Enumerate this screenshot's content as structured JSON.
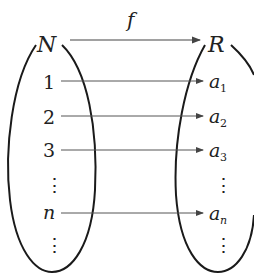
{
  "diagram": {
    "type": "mapping",
    "function_label": "f",
    "domain_set": {
      "label": "N",
      "elements": [
        "1",
        "2",
        "3",
        "⋮",
        "n",
        "⋮"
      ]
    },
    "codomain_set": {
      "label": "R",
      "elements": [
        "a1",
        "a2",
        "a3",
        "⋮",
        "an",
        "⋮"
      ]
    },
    "mappings": [
      {
        "from": "1",
        "to": "a1"
      },
      {
        "from": "2",
        "to": "a2"
      },
      {
        "from": "3",
        "to": "a3"
      },
      {
        "from": "n",
        "to": "an"
      }
    ],
    "subscripts": [
      "1",
      "2",
      "3",
      "n"
    ],
    "base_symbol": "a",
    "colors": {
      "stroke": "#1a1a1a",
      "arrow": "#555555",
      "text": "#222222"
    }
  }
}
